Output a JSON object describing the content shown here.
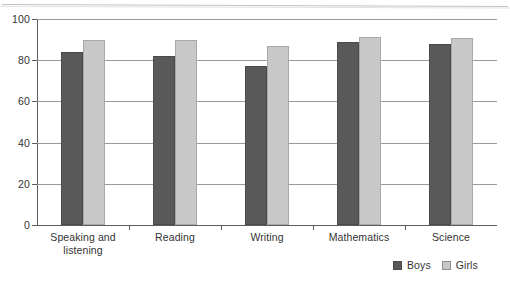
{
  "chart_data": {
    "type": "bar",
    "title": "",
    "subtitle": "",
    "xlabel": "",
    "ylabel": "",
    "ylim": [
      0,
      100
    ],
    "yticks": [
      0,
      20,
      40,
      60,
      80,
      100
    ],
    "ytick_labels": [
      "0",
      "20",
      "40",
      "60",
      "80",
      "100"
    ],
    "grid": true,
    "grid_axis": "y",
    "legend_position": "bottom-right",
    "categories": [
      "Speaking and\nlistening",
      "Reading",
      "Writing",
      "Mathematics",
      "Science"
    ],
    "series": [
      {
        "name": "Boys",
        "color": "#595959",
        "values": [
          84,
          82,
          77,
          89,
          88
        ]
      },
      {
        "name": "Girls",
        "color": "#c8c8c8",
        "values": [
          90,
          90,
          87,
          91.5,
          91
        ]
      }
    ]
  },
  "legend": {
    "items": [
      {
        "label": "Boys",
        "swatch": "boys-swatch"
      },
      {
        "label": "Girls",
        "swatch": "girls-swatch"
      }
    ]
  }
}
